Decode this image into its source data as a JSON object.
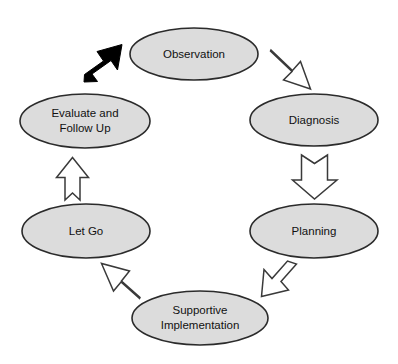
{
  "diagram": {
    "type": "cycle",
    "background_color": "#ffffff",
    "node_fill_color": "#dcdcdc",
    "node_border_color": "#2b2b2b",
    "open_arrow_fill_color": "#ffffff",
    "open_arrow_border_color": "#3a3a3a",
    "solid_arrow_color": "#000000",
    "nodes": [
      {
        "id": "observation",
        "label": "Observation",
        "lines": [
          "Observation"
        ],
        "cx": 194,
        "cy": 54,
        "rx": 64,
        "ry": 26
      },
      {
        "id": "diagnosis",
        "label": "Diagnosis",
        "lines": [
          "Diagnosis"
        ],
        "cx": 314,
        "cy": 120,
        "rx": 64,
        "ry": 26
      },
      {
        "id": "planning",
        "label": "Planning",
        "lines": [
          "Planning"
        ],
        "cx": 314,
        "cy": 231,
        "rx": 64,
        "ry": 27
      },
      {
        "id": "supportive-implementation",
        "label": "Supportive Implementation",
        "lines": [
          "Supportive",
          "Implementation"
        ],
        "cx": 200,
        "cy": 318,
        "rx": 68,
        "ry": 27
      },
      {
        "id": "let-go",
        "label": "Let Go",
        "lines": [
          "Let Go"
        ],
        "cx": 86,
        "cy": 231,
        "rx": 64,
        "ry": 27
      },
      {
        "id": "evaluate-and-follow-up",
        "label": "Evaluate and Follow Up",
        "lines": [
          "Evaluate and",
          "Follow Up"
        ],
        "cx": 85,
        "cy": 121,
        "rx": 65,
        "ry": 27
      }
    ],
    "arrows": [
      {
        "id": "arrow-evaluate-to-observation",
        "style": "solid",
        "direction": "up-right",
        "from": "evaluate-and-follow-up",
        "to": "observation"
      },
      {
        "id": "arrow-observation-to-diagnosis",
        "style": "outline",
        "direction": "down-right",
        "from": "observation",
        "to": "diagnosis"
      },
      {
        "id": "arrow-diagnosis-to-planning",
        "style": "outline",
        "direction": "down",
        "from": "diagnosis",
        "to": "planning"
      },
      {
        "id": "arrow-planning-to-supportive-implementation",
        "style": "outline",
        "direction": "down-left",
        "from": "planning",
        "to": "supportive-implementation"
      },
      {
        "id": "arrow-supportive-implementation-to-let-go",
        "style": "outline",
        "direction": "up-left",
        "from": "supportive-implementation",
        "to": "let-go"
      },
      {
        "id": "arrow-let-go-to-evaluate",
        "style": "outline",
        "direction": "up",
        "from": "let-go",
        "to": "evaluate-and-follow-up"
      }
    ]
  }
}
